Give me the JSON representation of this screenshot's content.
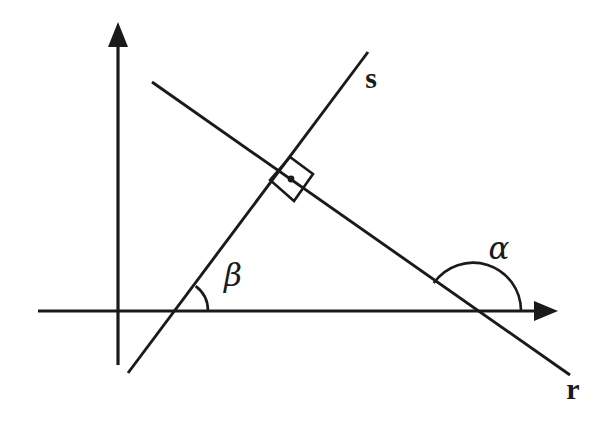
{
  "figure": {
    "kind": "geometry-diagram",
    "background_color": "#ffffff",
    "ink_color": "#1a1a1a",
    "width": 600,
    "height": 421
  },
  "axes": {
    "x_axis": {
      "label": "",
      "start": [
        38,
        311
      ],
      "end": [
        558,
        311
      ],
      "arrow_at_end": true
    },
    "y_axis": {
      "label": "",
      "start": [
        118,
        365
      ],
      "end": [
        118,
        22
      ],
      "arrow_at_end": true
    },
    "origin": [
      118,
      311
    ]
  },
  "lines": [
    {
      "name": "line-r",
      "label": "r",
      "label_position": [
        573,
        392
      ],
      "start": [
        152,
        82
      ],
      "end": [
        570,
        375
      ],
      "direction": "descending left-to-right"
    },
    {
      "name": "line-s",
      "label": "s",
      "label_position": [
        371,
        81
      ],
      "start": [
        128,
        373
      ],
      "end": [
        368,
        52
      ],
      "direction": "ascending left-to-right"
    }
  ],
  "intersections": {
    "lines_r_and_s": {
      "point": [
        282,
        172
      ],
      "marker": "right-angle",
      "marker_note": "small square with centre dot indicating 90 degrees"
    },
    "line_s_with_x_axis": [
      177,
      311
    ],
    "line_r_with_x_axis": [
      473,
      311
    ]
  },
  "angles": [
    {
      "name": "angle-alpha",
      "symbol": "α",
      "label_position": [
        499,
        250
      ],
      "vertex": [
        473,
        311
      ],
      "arc_radius": 48,
      "from_ray": "positive x-axis",
      "to_ray": "line r (upper-left branch)",
      "measure_degrees_approx": 145,
      "orientation": "obtuse, opening above the x-axis"
    },
    {
      "name": "angle-beta",
      "symbol": "β",
      "label_position": [
        233,
        277
      ],
      "vertex": [
        177,
        311
      ],
      "arc_radius": 31,
      "from_ray": "positive x-axis",
      "to_ray": "line s (upper-right branch)",
      "measure_degrees_approx": 53,
      "orientation": "acute, opening above the x-axis"
    }
  ],
  "labels": {
    "line_r": "r",
    "line_s": "s",
    "angle_alpha": "α",
    "angle_beta": "β"
  }
}
